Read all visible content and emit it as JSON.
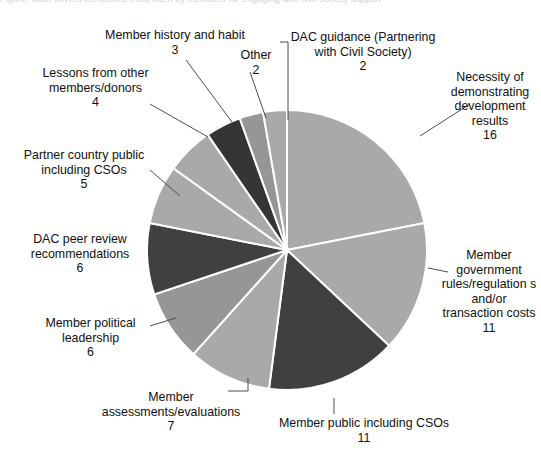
{
  "page": {
    "cut_off_header": "Figure: Main drivers mentioned most often by members for engaging with civil society support",
    "background": "#ffffff"
  },
  "chart_data": {
    "type": "pie",
    "title": "",
    "total": 73,
    "legend_position": "callout-labels",
    "grid": false,
    "colors": {
      "light_gray": "#a9a9a9",
      "mid_gray": "#969696",
      "dark_gray": "#404040",
      "darker_gray": "#353535",
      "separator": "#ffffff",
      "leader_line": "#4d4d4d"
    },
    "categories": [
      "Necessity of demonstrating development results",
      "Member government rules/regulations and/or transaction costs",
      "Member public including CSOs",
      "Member assessments/evaluations",
      "Member political leadership",
      "DAC peer review recommendations",
      "Partner country public including CSOs",
      "Lessons from other members/donors",
      "Member history and habit",
      "Other",
      "DAC guidance (Partnering with Civil Society)"
    ],
    "values": [
      16,
      11,
      11,
      7,
      6,
      6,
      5,
      4,
      3,
      2,
      2
    ],
    "slice_colors": [
      "#a9a9a9",
      "#a9a9a9",
      "#404040",
      "#a9a9a9",
      "#969696",
      "#404040",
      "#a9a9a9",
      "#a9a9a9",
      "#353535",
      "#969696",
      "#a9a9a9"
    ]
  },
  "labels": [
    {
      "id": "necessity",
      "name": "Necessity of demonstrating development results",
      "text": "Necessity of demonstrating development results",
      "value": "16"
    },
    {
      "id": "govrules",
      "name": "Member government rules/regulations and/or transaction costs",
      "text": "Member government rules/regulation s and/or transaction costs",
      "value": "11"
    },
    {
      "id": "memberpublic",
      "name": "Member public including CSOs",
      "text": "Member public including CSOs",
      "value": "11"
    },
    {
      "id": "assessments",
      "name": "Member assessments/evaluations",
      "text": "Member assessments/evaluations",
      "value": "7"
    },
    {
      "id": "political",
      "name": "Member political leadership",
      "text": "Member political leadership",
      "value": "6"
    },
    {
      "id": "peerreview",
      "name": "DAC peer review recommendations",
      "text": "DAC peer review recommendations",
      "value": "6"
    },
    {
      "id": "partner",
      "name": "Partner country public including CSOs",
      "text": "Partner country public including CSOs",
      "value": "5"
    },
    {
      "id": "lessons",
      "name": "Lessons from other members/donors",
      "text": "Lessons from other members/donors",
      "value": "4"
    },
    {
      "id": "history",
      "name": "Member history and habit",
      "text": "Member history and habit",
      "value": "3"
    },
    {
      "id": "other",
      "name": "Other",
      "text": "Other",
      "value": "2"
    },
    {
      "id": "dac-guid",
      "name": "DAC guidance (Partnering with Civil Society)",
      "text": "DAC guidance (Partnering with Civil Society)",
      "value": "2"
    }
  ]
}
